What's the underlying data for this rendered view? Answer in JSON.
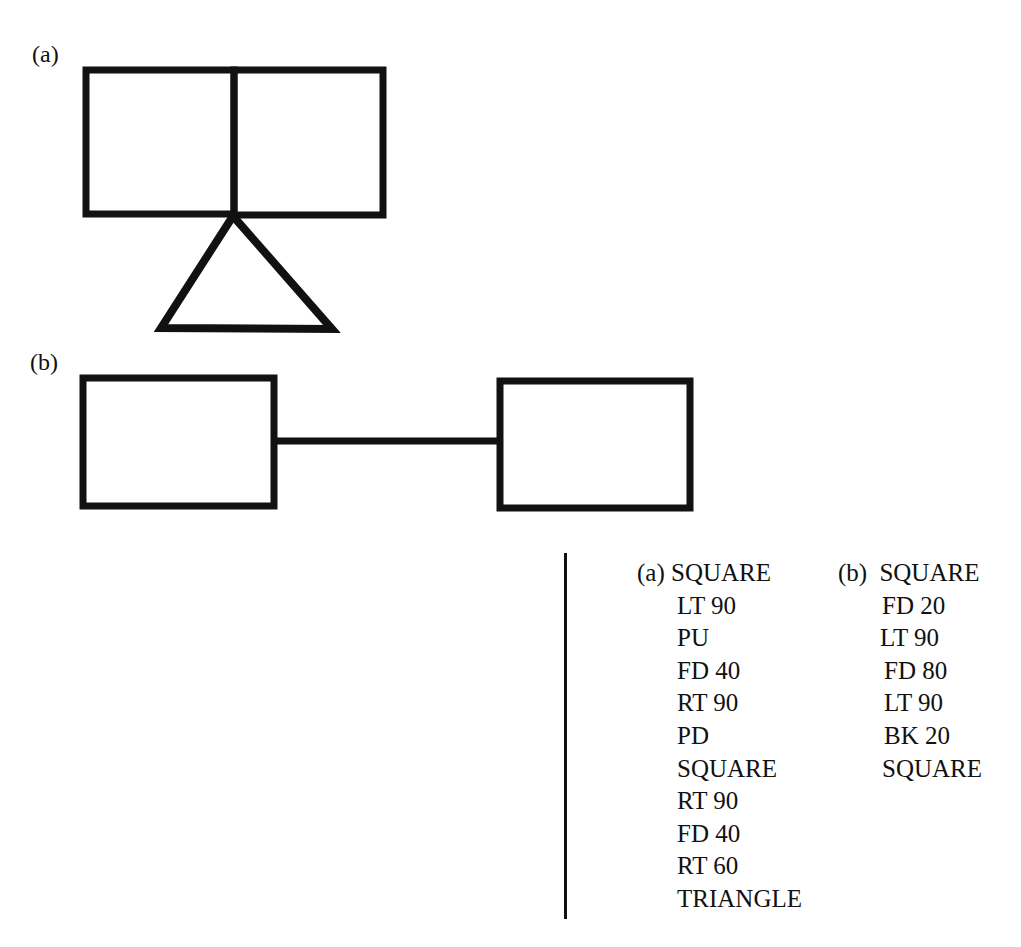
{
  "figure_a": {
    "label": "(a)",
    "description": "Two adjacent squares sharing a side, with a triangle hanging from the shared bottom vertex"
  },
  "figure_b": {
    "label": "(b)",
    "description": "Two squares connected by a horizontal line"
  },
  "programs": {
    "a": {
      "label": "(a)",
      "lines": [
        "SQUARE",
        "LT 90",
        "PU",
        "FD 40",
        "RT 90",
        "PD",
        "SQUARE",
        "RT 90",
        "FD 40",
        "RT 60",
        "TRIANGLE"
      ]
    },
    "b": {
      "label": "(b)",
      "lines": [
        "SQUARE",
        "FD 20",
        "LT 90",
        "FD 80",
        "LT 90",
        "BK 20",
        "SQUARE"
      ]
    }
  },
  "colors": {
    "stroke": "#111111",
    "background": "#ffffff"
  }
}
